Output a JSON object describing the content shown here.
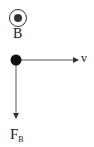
{
  "diagram": {
    "type": "physics-vector-diagram",
    "magnetic_field": {
      "symbol": "out-of-page-circle",
      "label": "B"
    },
    "particle": {
      "symbol": "filled-dot"
    },
    "velocity": {
      "direction": "right",
      "label": "v"
    },
    "force": {
      "direction": "down",
      "label": "F",
      "subscript": "B"
    },
    "colors": {
      "stroke": "#333333",
      "fill": "#111111",
      "background": "#ffffff"
    }
  }
}
